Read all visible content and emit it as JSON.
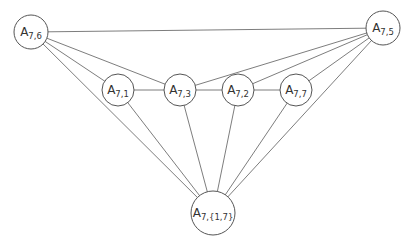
{
  "diagram": {
    "type": "graph",
    "nodes": [
      {
        "id": "A76",
        "base": "A",
        "sub": "7,6",
        "x": 31,
        "y": 32,
        "r": 17
      },
      {
        "id": "A75",
        "base": "A",
        "sub": "7,5",
        "x": 383,
        "y": 28,
        "r": 17
      },
      {
        "id": "A71",
        "base": "A",
        "sub": "7,1",
        "x": 118,
        "y": 90,
        "r": 16
      },
      {
        "id": "A73",
        "base": "A",
        "sub": "7,3",
        "x": 180,
        "y": 90,
        "r": 16
      },
      {
        "id": "A72",
        "base": "A",
        "sub": "7,2",
        "x": 238,
        "y": 90,
        "r": 16
      },
      {
        "id": "A77",
        "base": "A",
        "sub": "7,7",
        "x": 296,
        "y": 90,
        "r": 16
      },
      {
        "id": "A717",
        "base": "A",
        "sub": "7,{1,7}",
        "x": 213,
        "y": 213,
        "r": 22
      }
    ],
    "edges": [
      [
        "A76",
        "A75"
      ],
      [
        "A76",
        "A71"
      ],
      [
        "A76",
        "A73"
      ],
      [
        "A76",
        "A717"
      ],
      [
        "A75",
        "A73"
      ],
      [
        "A75",
        "A72"
      ],
      [
        "A75",
        "A77"
      ],
      [
        "A75",
        "A717"
      ],
      [
        "A71",
        "A73"
      ],
      [
        "A73",
        "A72"
      ],
      [
        "A72",
        "A77"
      ],
      [
        "A71",
        "A717"
      ],
      [
        "A73",
        "A717"
      ],
      [
        "A72",
        "A717"
      ],
      [
        "A77",
        "A717"
      ]
    ],
    "colors": {
      "edge": "#6e6e6e",
      "node_stroke": "#555555",
      "text": "#333333",
      "background": "#ffffff"
    }
  }
}
